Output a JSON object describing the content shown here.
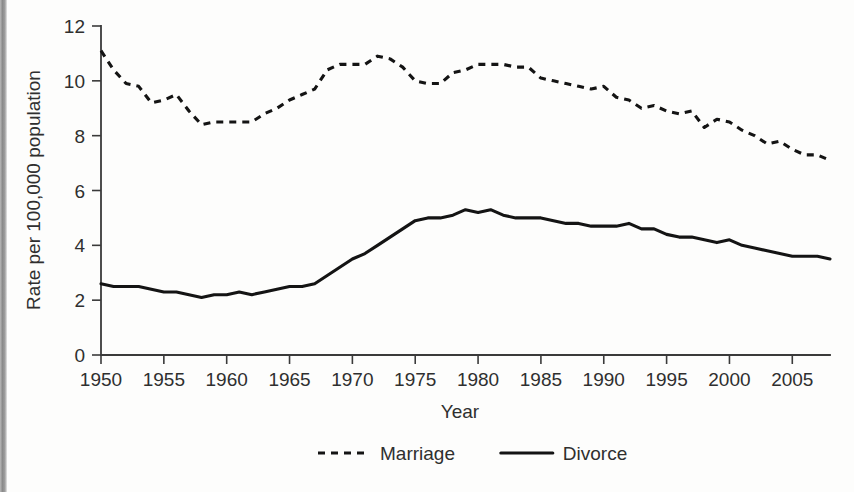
{
  "chart_data": {
    "type": "line",
    "title": "",
    "xlabel": "Year",
    "ylabel": "Rate per 100,000 population",
    "xlim": [
      1950,
      2008
    ],
    "ylim": [
      0,
      12
    ],
    "xticks": [
      1950,
      1955,
      1960,
      1965,
      1970,
      1975,
      1980,
      1985,
      1990,
      1995,
      2000,
      2005
    ],
    "yticks": [
      0,
      2,
      4,
      6,
      8,
      10,
      12
    ],
    "grid": false,
    "legend_position": "bottom-center",
    "x": [
      1950,
      1951,
      1952,
      1953,
      1954,
      1955,
      1956,
      1957,
      1958,
      1959,
      1960,
      1961,
      1962,
      1963,
      1964,
      1965,
      1966,
      1967,
      1968,
      1969,
      1970,
      1971,
      1972,
      1973,
      1974,
      1975,
      1976,
      1977,
      1978,
      1979,
      1980,
      1981,
      1982,
      1983,
      1984,
      1985,
      1986,
      1987,
      1988,
      1989,
      1990,
      1991,
      1992,
      1993,
      1994,
      1995,
      1996,
      1997,
      1998,
      1999,
      2000,
      2001,
      2002,
      2003,
      2004,
      2005,
      2006,
      2007,
      2008
    ],
    "series": [
      {
        "name": "Marriage",
        "style": "dashed",
        "color": "#141414",
        "values": [
          11.1,
          10.4,
          9.9,
          9.8,
          9.2,
          9.3,
          9.5,
          8.9,
          8.4,
          8.5,
          8.5,
          8.5,
          8.5,
          8.8,
          9.0,
          9.3,
          9.5,
          9.7,
          10.4,
          10.6,
          10.6,
          10.6,
          10.9,
          10.8,
          10.5,
          10.0,
          9.9,
          9.9,
          10.3,
          10.4,
          10.6,
          10.6,
          10.6,
          10.5,
          10.5,
          10.1,
          10.0,
          9.9,
          9.8,
          9.7,
          9.8,
          9.4,
          9.3,
          9.0,
          9.1,
          8.9,
          8.8,
          8.9,
          8.3,
          8.6,
          8.5,
          8.2,
          8.0,
          7.7,
          7.8,
          7.5,
          7.3,
          7.3,
          7.1
        ]
      },
      {
        "name": "Divorce",
        "style": "solid",
        "color": "#141414",
        "values": [
          2.6,
          2.5,
          2.5,
          2.5,
          2.4,
          2.3,
          2.3,
          2.2,
          2.1,
          2.2,
          2.2,
          2.3,
          2.2,
          2.3,
          2.4,
          2.5,
          2.5,
          2.6,
          2.9,
          3.2,
          3.5,
          3.7,
          4.0,
          4.3,
          4.6,
          4.9,
          5.0,
          5.0,
          5.1,
          5.3,
          5.2,
          5.3,
          5.1,
          5.0,
          5.0,
          5.0,
          4.9,
          4.8,
          4.8,
          4.7,
          4.7,
          4.7,
          4.8,
          4.6,
          4.6,
          4.4,
          4.3,
          4.3,
          4.2,
          4.1,
          4.2,
          4.0,
          3.9,
          3.8,
          3.7,
          3.6,
          3.6,
          3.6,
          3.5
        ]
      }
    ],
    "legend": [
      {
        "label": "Marriage",
        "style": "dashed"
      },
      {
        "label": "Divorce",
        "style": "solid"
      }
    ]
  }
}
